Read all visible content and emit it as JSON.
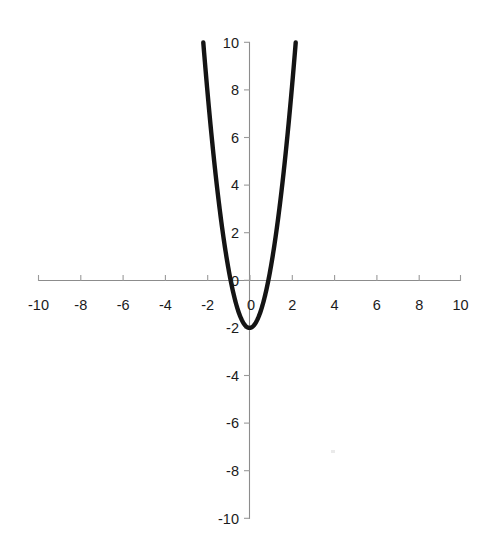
{
  "chart_data": {
    "type": "line",
    "title": "",
    "subtitle": "",
    "xlabel": "",
    "ylabel": "",
    "xlim": [
      -10,
      10
    ],
    "ylim": [
      -10,
      10
    ],
    "grid": false,
    "legend": null,
    "legend_position": "none",
    "annotations": [],
    "background_color": "#ffffff",
    "curve_color": "#141414",
    "axis_color": "#8c8c8c",
    "label_color": "#1b1b1b",
    "x_ticks": [
      -10,
      -8,
      -6,
      -4,
      -2,
      0,
      2,
      4,
      6,
      8,
      10
    ],
    "x_tick_labels": [
      "-10",
      "-8",
      "-6",
      "-4",
      "-2",
      "0",
      "2",
      "4",
      "6",
      "8",
      "10"
    ],
    "y_ticks": [
      -10,
      -8,
      -6,
      -4,
      -2,
      0,
      2,
      4,
      6,
      8,
      10
    ],
    "y_tick_labels": [
      "-10",
      "-8",
      "-6",
      "-4",
      "-2",
      "0",
      "2",
      "4",
      "6",
      "8",
      "10"
    ],
    "series": [
      {
        "name": "parabola",
        "equation": "y = 2.5x^2 - 2",
        "vertex": [
          0,
          -2
        ],
        "roots": [
          -0.894,
          0.894
        ],
        "x": [
          -2.19,
          -2.0,
          -1.8,
          -1.6,
          -1.4,
          -1.2,
          -1.0,
          -0.894,
          -0.8,
          -0.6,
          -0.4,
          -0.2,
          0.0,
          0.2,
          0.4,
          0.6,
          0.8,
          0.894,
          1.0,
          1.2,
          1.4,
          1.6,
          1.8,
          2.0,
          2.19
        ],
        "values": [
          10.0,
          8.0,
          6.1,
          4.4,
          2.9,
          1.6,
          0.5,
          0.0,
          -0.4,
          -1.1,
          -1.6,
          -1.9,
          -2.0,
          -1.9,
          -1.6,
          -1.1,
          -0.4,
          0.0,
          0.5,
          1.6,
          2.9,
          4.4,
          6.1,
          8.0,
          10.0
        ]
      }
    ]
  },
  "axes": {
    "x_axis_name": "horizontal-axis",
    "y_axis_name": "vertical-axis"
  }
}
